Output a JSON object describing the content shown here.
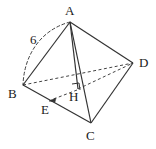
{
  "figure": {
    "type": "geometry-diagram",
    "background_color": "#ffffff",
    "stroke_color": "#333333",
    "label_color": "#1a1a1a",
    "canvas": {
      "width": 156,
      "height": 149
    }
  },
  "vertices": [
    {
      "id": "A",
      "label": "A",
      "x": 70,
      "y": 22,
      "label_x": 65,
      "label_y": 4
    },
    {
      "id": "B",
      "label": "B",
      "x": 23,
      "y": 85,
      "label_x": 8,
      "label_y": 87
    },
    {
      "id": "C",
      "label": "C",
      "x": 91,
      "y": 123,
      "label_x": 86,
      "label_y": 129
    },
    {
      "id": "D",
      "label": "D",
      "x": 133,
      "y": 63,
      "label_x": 139,
      "label_y": 56
    },
    {
      "id": "H",
      "label": "H",
      "x": 78,
      "y": 89,
      "label_x": 69,
      "label_y": 90
    },
    {
      "id": "E",
      "label": "E",
      "x": 50,
      "y": 101,
      "label_x": 41,
      "label_y": 103
    }
  ],
  "measure_labels": [
    {
      "id": "AB-length",
      "text": "6",
      "x": 30,
      "y": 33
    }
  ],
  "edges": [
    {
      "id": "A-B",
      "from": "A",
      "to": "B",
      "style": "solid"
    },
    {
      "id": "A-D",
      "from": "A",
      "to": "D",
      "style": "solid"
    },
    {
      "id": "A-C",
      "from": "A",
      "to": "C",
      "style": "solid"
    },
    {
      "id": "B-C",
      "from": "B",
      "to": "C",
      "style": "solid"
    },
    {
      "id": "C-D",
      "from": "C",
      "to": "D",
      "style": "solid"
    },
    {
      "id": "B-D",
      "from": "B",
      "to": "D",
      "style": "dashed"
    },
    {
      "id": "A-H",
      "from": "A",
      "to": "H",
      "style": "solid"
    },
    {
      "id": "H-D",
      "from": "H",
      "to": "D",
      "style": "dashed"
    },
    {
      "id": "H-E",
      "from": "H",
      "to": "E",
      "style": "dashed",
      "arrow": true
    }
  ],
  "arc": {
    "id": "AB-arc",
    "from": "A",
    "to": "B",
    "style": "dashed",
    "bulge": "left"
  },
  "right_angle_marker": {
    "id": "right-angle-at-H",
    "at": "H",
    "size": 7
  }
}
